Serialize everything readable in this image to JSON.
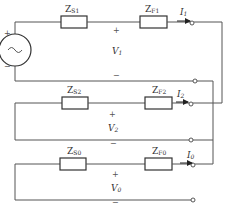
{
  "diagram": {
    "source": {
      "symbol": "~",
      "plus": "+",
      "minus": "−",
      "label": "E"
    },
    "networks": [
      {
        "zs": {
          "main": "Z",
          "sub": "S1"
        },
        "zf": {
          "main": "Z",
          "sub": "F1"
        },
        "current": {
          "main": "I",
          "sub": "1"
        },
        "voltage": {
          "main": "V",
          "sub": "1"
        },
        "plus": "+",
        "minus": "−"
      },
      {
        "zs": {
          "main": "Z",
          "sub": "S2"
        },
        "zf": {
          "main": "Z",
          "sub": "F2"
        },
        "current": {
          "main": "I",
          "sub": "2"
        },
        "voltage": {
          "main": "V",
          "sub": "2"
        },
        "plus": "+",
        "minus": "−"
      },
      {
        "zs": {
          "main": "Z",
          "sub": "S0"
        },
        "zf": {
          "main": "Z",
          "sub": "F0"
        },
        "current": {
          "main": "I",
          "sub": "0"
        },
        "voltage": {
          "main": "V",
          "sub": "0"
        },
        "plus": "+",
        "minus": "−"
      }
    ],
    "colors": {
      "wire": "#555555",
      "component": "#333333",
      "background": "#ffffff"
    }
  }
}
